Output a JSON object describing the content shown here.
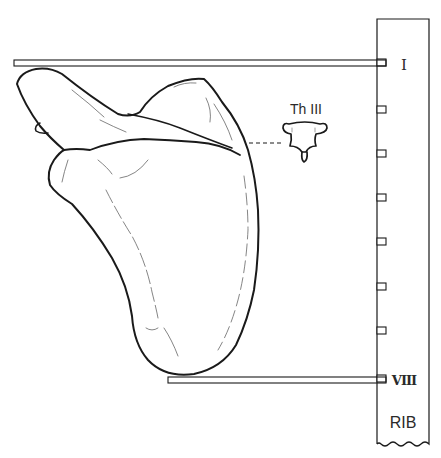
{
  "figure": {
    "type": "anatomical-diagram"
  },
  "labels": {
    "vertebra": "Th III",
    "rib_top": "I",
    "rib_bottom": "VIII",
    "scale_title": "RIB"
  },
  "rib_scale": {
    "tick_count": 8,
    "tick_labels_visible": [
      "I",
      "VIII"
    ]
  },
  "colors": {
    "line": "#1a1a1a",
    "faint_line": "#5a5a5a",
    "background": "#ffffff"
  }
}
